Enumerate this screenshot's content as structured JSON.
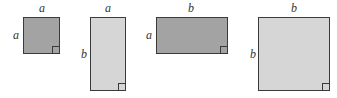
{
  "figure": {
    "shapes": [
      {
        "id": "square-a",
        "width_label": "a",
        "height_label": "a",
        "fill": "#a3a3a3"
      },
      {
        "id": "rect-a-by-b",
        "width_label": "a",
        "height_label": "b",
        "fill": "#d6d6d6"
      },
      {
        "id": "rect-b-by-a",
        "width_label": "b",
        "height_label": "a",
        "fill": "#a3a3a3"
      },
      {
        "id": "square-b",
        "width_label": "b",
        "height_label": "b",
        "fill": "#d6d6d6"
      }
    ],
    "border_color": "#3a3a3a"
  }
}
